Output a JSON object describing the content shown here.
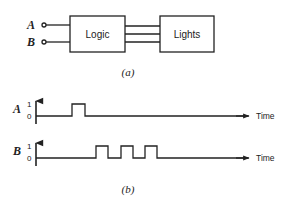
{
  "diagram_a": {
    "caption": "(a)",
    "inputs": [
      {
        "label": "A"
      },
      {
        "label": "B"
      }
    ],
    "blocks": [
      {
        "label": "Logic"
      },
      {
        "label": "Lights"
      }
    ],
    "connection_count": 3
  },
  "diagram_b": {
    "caption": "(b)",
    "waveforms": [
      {
        "signal": "A",
        "high_label": "1",
        "low_label": "0",
        "axis_label": "Time",
        "pulses": 1
      },
      {
        "signal": "B",
        "high_label": "1",
        "low_label": "0",
        "axis_label": "Time",
        "pulses": 3
      }
    ]
  },
  "colors": {
    "ink": "#222222",
    "background": "#ffffff"
  }
}
